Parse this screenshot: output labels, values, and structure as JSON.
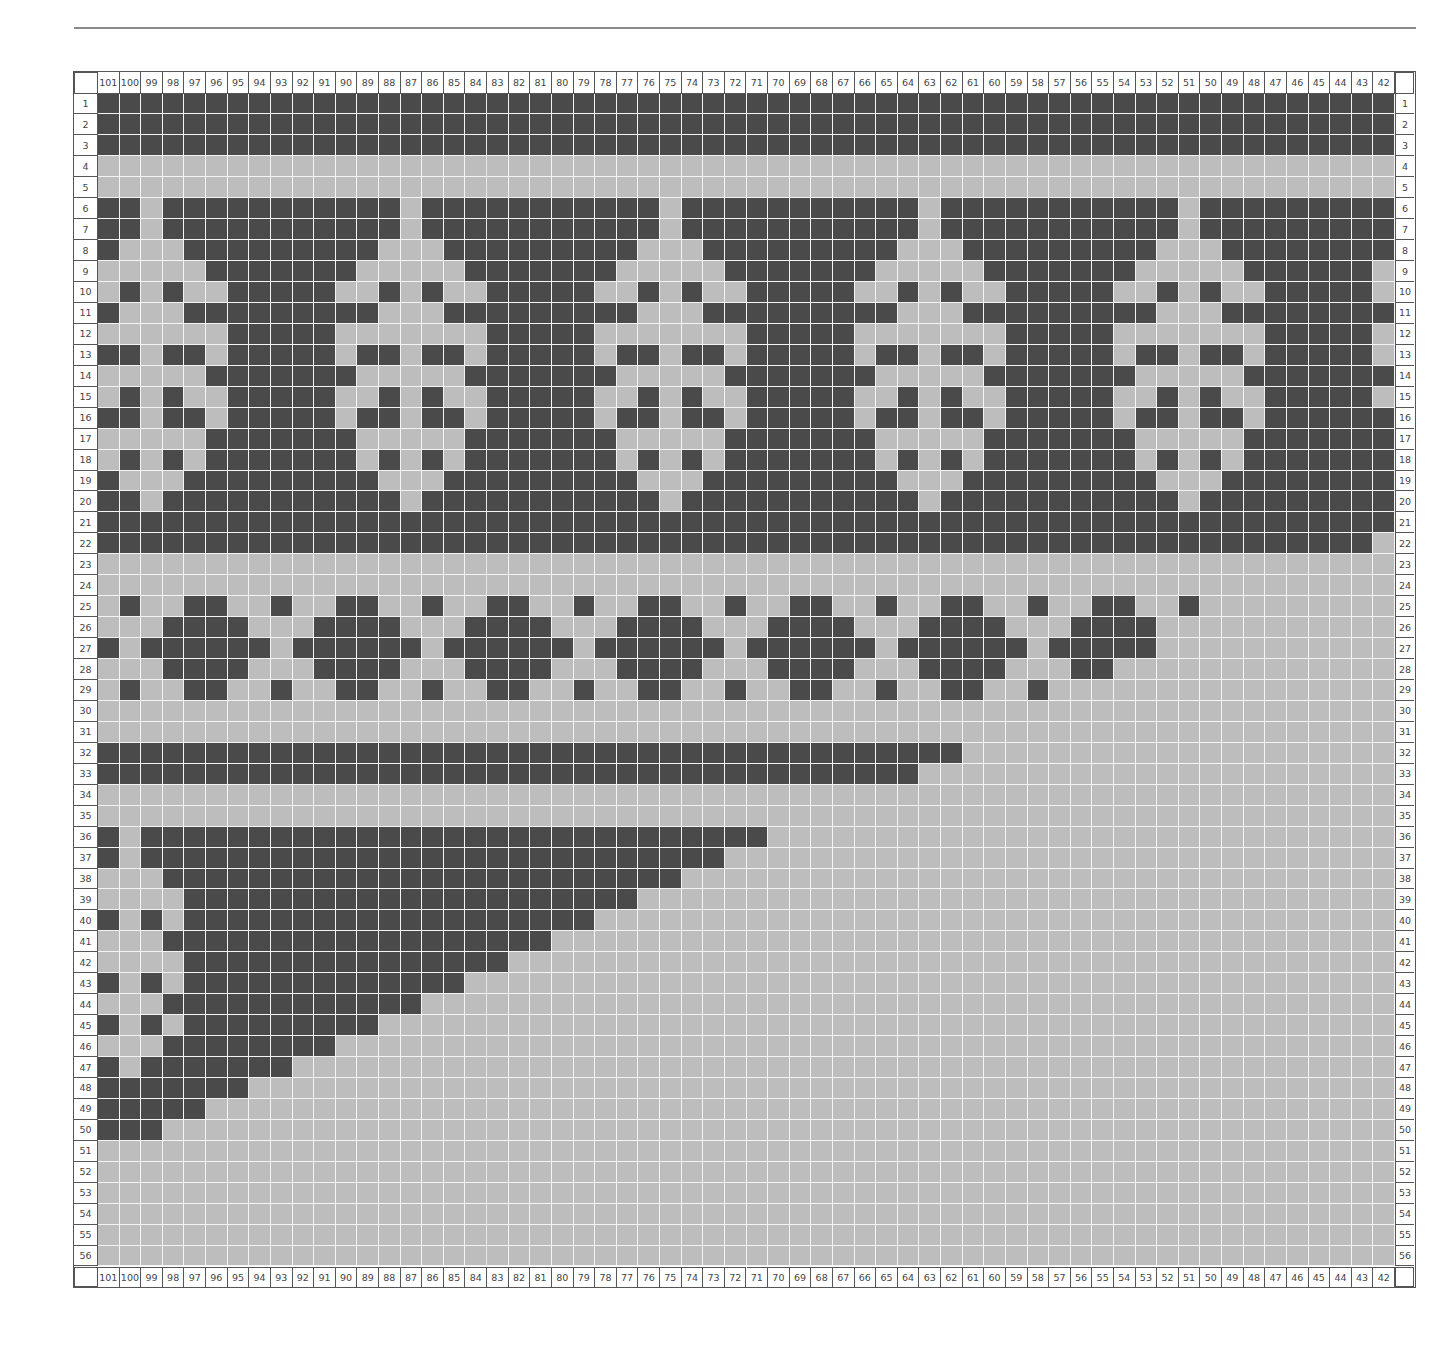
{
  "chart": {
    "type": "knitting-colorwork-chart",
    "columns": [
      101,
      100,
      99,
      98,
      97,
      96,
      95,
      94,
      93,
      92,
      91,
      90,
      89,
      88,
      87,
      86,
      85,
      84,
      83,
      82,
      81,
      80,
      79,
      78,
      77,
      76,
      75,
      74,
      73,
      72,
      71,
      70,
      69,
      68,
      67,
      66,
      65,
      64,
      63,
      62,
      61,
      60,
      59,
      58,
      57,
      56,
      55,
      54,
      53,
      52,
      51,
      50,
      49,
      48,
      47,
      46,
      45,
      44,
      43,
      42
    ],
    "row_count": 56,
    "legend": {
      "D": "dark contrast color",
      "L": "light main color"
    },
    "colors": {
      "dark": "#4a4a4a",
      "light": "#bdbdbd",
      "gridline": "#f4f4f4",
      "frame": "#555555"
    },
    "rows": [
      "DDDDDDDDDDDDDDDDDDDDDDDDDDDDDDDDDDDDDDDDDDDDDDDDDDDDDDDDDDDD",
      "DDDDDDDDDDDDDDDDDDDDDDDDDDDDDDDDDDDDDDDDDDDDDDDDDDDDDDDDDDDD",
      "DDDDDDDDDDDDDDDDDDDDDDDDDDDDDDDDDDDDDDDDDDDDDDDDDDDDDDDDDDDD",
      "LLLLLLLLLLLLLLLLLLLLLLLLLLLLLLLLLLLLLLLLLLLLLLLLLLLLLLLLLLLL",
      "LLLLLLLLLLLLLLLLLLLLLLLLLLLLLLLLLLLLLLLLLLLLLLLLLLLLLLLLLLLL",
      "DDLDDDDDDDDDDDLDDDDDDDDDDDLDDDDDDDDDDDLDDDDDDDDDDDLDDDDDDDDD",
      "DDLDDDDDDDDDDDLDDDDDDDDDDDLDDDDDDDDDDDLDDDDDDDDDDDLDDDDDDDDD",
      "DLLLDDDDDDDDDLLLDDDDDDDDDLLLDDDDDDDDDLLLDDDDDDDDDLLLDDDDDDDD",
      "LLLLLDDDDDDDLLLLLDDDDDDDLLLLLDDDDDDDLLLLLDDDDDDDLLLLLDDDDDDL",
      "LDLDLLDDDDDLLDLDLLDDDDDLLDLDLLDDDDDLLDLDLLDDDDDLLDLDLLDDDDDL",
      "DLLLDDDDDDDDDLLLDDDDDDDDDLLLDDDDDDDDDLLLDDDDDDDDDLLLDDDDDDDD",
      "LLLLLLDDDDDLLLLLLLDDDDDLLLLLLLDDDDDLLLLLLLDDDDDLLLLLLLDDDDDL",
      "DDLDDLDDDDDLDDLDDLDDDDDLDDLDDLDDDDDLDDLDDLDDDDDLDDLDDLDDDDDL",
      "LLLLLDDDDDDDLLLLLDDDDDDDLLLLLDDDDDDDLLLLLDDDDDDDLLLLLDDDDDDD",
      "LDLDLLDDDDDLLDLDLLDDDDDLLDLDLLDDDDDLLDLDLLDDDDDLLDLDLLDDDDDL",
      "DDLDDLDDDDDLDDLDDLDDDDDLDDLDDLDDDDDLDDLDDLDDDDDLDDLDDLDDDDDD",
      "LLLLLDDDDDDDLLLLLDDDDDDDLLLLLDDDDDDDLLLLLDDDDDDDLLLLLDDDDDDD",
      "LDLDLDDDDDDDLDLDLDDDDDDDLDLDLDDDDDDDLDLDLDDDDDDDLDLDLDDDDDDD",
      "DLLLDDDDDDDDDLLLDDDDDDDDDLLLDDDDDDDDDLLLDDDDDDDDDLLLDDDDDDDD",
      "DDLDDDDDDDDDDDLDDDDDDDDDDDLDDDDDDDDDDDLDDDDDDDDDDDLDDDDDDDDD",
      "DDDDDDDDDDDDDDDDDDDDDDDDDDDDDDDDDDDDDDDDDDDDDDDDDDDDDDDDDDDD",
      "DDDDDDDDDDDDDDDDDDDDDDDDDDDDDDDDDDDDDDDDDDDDDDDDDDDDDDDDDDDL",
      "LLLLLLLLLLLLLLLLLLLLLLLLLLLLLLLLLLLLLLLLLLLLLLLLLLLLLLLLLLLL",
      "LLLLLLLLLLLLLLLLLLLLLLLLLLLLLLLLLLLLLLLLLLLLLLLLLLLLLLLLLLLL",
      "LDLLDDLLDLLDDLLDLLDDLLDLLDDLLDLLDDLLDLLDDLLDLLDDLLDLLLLLLLLL",
      "LLLDDDDLLLDDDDLLLDDDDLLLDDDDLLLDDDDLLLDDDDLLLDDDDLLLLLLLLLLL",
      "DLDDDDDDLDDDDDDLDDDDDDLDDDDDDLDDDDDDLDDDDDDLDDDDDLLLLLLLLLLL",
      "LLLDDDDLLLDDDDLLLDDDDLLLDDDDLLLDDDDLLLDDDDLLLDDLLLLLLLLLLLLL",
      "LDLLDDLLDLLDDLLDLLDDLLDLLDDLLDLLDDLLDLLDDLLDLLLLLLLLLLLLLLLL",
      "LLLLLLLLLLLLLLLLLLLLLLLLLLLLLLLLLLLLLLLLLLLLLLLLLLLLLLLLLLLL",
      "LLLLLLLLLLLLLLLLLLLLLLLLLLLLLLLLLLLLLLLLLLLLLLLLLLLLLLLLLLLL",
      "DDDDDDDDDDDDDDDDDDDDDDDDDDDDDDDDDDDDDDDDLLLLLLLLLLLLLLLLLLLL",
      "DDDDDDDDDDDDDDDDDDDDDDDDDDDDDDDDDDDDDDLLLLLLLLLLLLLLLLLLLLLL",
      "LLLLLLLLLLLLLLLLLLLLLLLLLLLLLLLLLLLLLLLLLLLLLLLLLLLLLLLLLLLL",
      "LLLLLLLLLLLLLLLLLLLLLLLLLLLLLLLLLLLLLLLLLLLLLLLLLLLLLLLLLLLL",
      "DLDDDDDDDDDDDDDDDDDDDDDDDDDDDDDLLLLLLLLLLLLLLLLLLLLLLLLLLLLL",
      "DLDDDDDDDDDDDDDDDDDDDDDDDDDDDLLLLLLLLLLLLLLLLLLLLLLLLLLLLLLL",
      "LLLDDDDDDDDDDDDDDDDDDDDDDDDLLLLLLLLLLLLLLLLLLLLLLLLLLLLLLLLL",
      "LLLLDDDDDDDDDDDDDDDDDDDDDLLLLLLLLLLLLLLLLLLLLLLLLLLLLLLLLLLL",
      "DLDLDDDDDDDDDDDDDDDDDDDLLLLLLLLLLLLLLLLLLLLLLLLLLLLLLLLLLLLL",
      "LLLDDDDDDDDDDDDDDDDDDLLLLLLLLLLLLLLLLLLLLLLLLLLLLLLLLLLLLLLL",
      "LLLLDDDDDDDDDDDDDDDLLLLLLLLLLLLLLLLLLLLLLLLLLLLLLLLLLLLLLLLL",
      "DLDLDDDDDDDDDDDDDLLLLLLLLLLLLLLLLLLLLLLLLLLLLLLLLLLLLLLLLLLL",
      "LLLDDDDDDDDDDDDLLLLLLLLLLLLLLLLLLLLLLLLLLLLLLLLLLLLLLLLLLLLL",
      "DLDLDDDDDDDDDLLLLLLLLLLLLLLLLLLLLLLLLLLLLLLLLLLLLLLLLLLLLLLL",
      "LLLDDDDDDDDLLLLLLLLLLLLLLLLLLLLLLLLLLLLLLLLLLLLLLLLLLLLLLLLL",
      "DLDDDDDDDLLLLLLLLLLLLLLLLLLLLLLLLLLLLLLLLLLLLLLLLLLLLLLLLLLL",
      "DDDDDDDLLLLLLLLLLLLLLLLLLLLLLLLLLLLLLLLLLLLLLLLLLLLLLLLLLLLL",
      "DDDDDLLLLLLLLLLLLLLLLLLLLLLLLLLLLLLLLLLLLLLLLLLLLLLLLLLLLLLL",
      "DDDLLLLLLLLLLLLLLLLLLLLLLLLLLLLLLLLLLLLLLLLLLLLLLLLLLLLLLLLL",
      "LLLLLLLLLLLLLLLLLLLLLLLLLLLLLLLLLLLLLLLLLLLLLLLLLLLLLLLLLLLL",
      "LLLLLLLLLLLLLLLLLLLLLLLLLLLLLLLLLLLLLLLLLLLLLLLLLLLLLLLLLLLL",
      "LLLLLLLLLLLLLLLLLLLLLLLLLLLLLLLLLLLLLLLLLLLLLLLLLLLLLLLLLLLL",
      "LLLLLLLLLLLLLLLLLLLLLLLLLLLLLLLLLLLLLLLLLLLLLLLLLLLLLLLLLLLL",
      "LLLLLLLLLLLLLLLLLLLLLLLLLLLLLLLLLLLLLLLLLLLLLLLLLLLLLLLLLLLL",
      "LLLLLLLLLLLLLLLLLLLLLLLLLLLLLLLLLLLLLLLLLLLLLLLLLLLLLLLLLLLL"
    ]
  }
}
